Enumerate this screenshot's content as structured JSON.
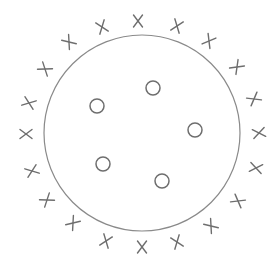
{
  "diagram": {
    "colors": {
      "background": "#ffffff",
      "boundary": "#8a8a8a",
      "marks": "#6e6e6e"
    },
    "boundary": {
      "shape": "circle",
      "cx": 142,
      "cy": 133,
      "r": 98
    },
    "classes": [
      {
        "name": "O",
        "label": "O",
        "count": 5
      },
      {
        "name": "X",
        "label": "X",
        "count": 20
      }
    ],
    "o_points": [
      {
        "x": 153,
        "y": 88
      },
      {
        "x": 97,
        "y": 106
      },
      {
        "x": 195,
        "y": 130
      },
      {
        "x": 103,
        "y": 164
      },
      {
        "x": 162,
        "y": 181
      }
    ],
    "o_radius": 7,
    "x_points": [
      {
        "x": 138,
        "y": 21,
        "rot": 0
      },
      {
        "x": 177,
        "y": 26,
        "rot": 20
      },
      {
        "x": 209,
        "y": 41,
        "rot": 30
      },
      {
        "x": 237,
        "y": 67,
        "rot": 45
      },
      {
        "x": 254,
        "y": 99,
        "rot": 60
      },
      {
        "x": 259,
        "y": 133,
        "rot": 80
      },
      {
        "x": 256,
        "y": 168,
        "rot": 100
      },
      {
        "x": 238,
        "y": 201,
        "rot": 120
      },
      {
        "x": 211,
        "y": 226,
        "rot": 140
      },
      {
        "x": 177,
        "y": 242,
        "rot": 160
      },
      {
        "x": 142,
        "y": 247,
        "rot": 180
      },
      {
        "x": 106,
        "y": 241,
        "rot": 200
      },
      {
        "x": 73,
        "y": 223,
        "rot": 220
      },
      {
        "x": 47,
        "y": 200,
        "rot": 235
      },
      {
        "x": 32,
        "y": 171,
        "rot": 250
      },
      {
        "x": 26,
        "y": 134,
        "rot": 270
      },
      {
        "x": 29,
        "y": 103,
        "rot": 290
      },
      {
        "x": 45,
        "y": 69,
        "rot": 305
      },
      {
        "x": 69,
        "y": 42,
        "rot": 320
      },
      {
        "x": 102,
        "y": 27,
        "rot": 340
      }
    ],
    "x_size": 6
  }
}
